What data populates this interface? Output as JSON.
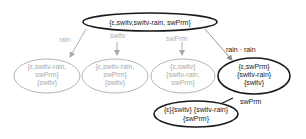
{
  "colors": {
    "active": "#1a1a1a",
    "faded_stroke": "#b5b5b5",
    "faded_text": "#aaaaaa",
    "active_edge": "#999999",
    "background": "#ffffff"
  },
  "nodes": {
    "root": {
      "lines": [
        "{ε,switv,switv-rain, swPrm}"
      ],
      "style": "active"
    },
    "n_rain": {
      "lines": [
        "{ε,switv-rain,",
        "swPrm}",
        "{switv}"
      ],
      "style": "faded"
    },
    "n_switv": {
      "lines": [
        "{ε,switv-rain,",
        "swPrm}",
        "{switv}"
      ],
      "style": "faded"
    },
    "n_swPrm": {
      "lines": [
        "{ε,switv}",
        "{switv-rain,",
        "swPrm}"
      ],
      "style": "faded"
    },
    "n_rainrain": {
      "lines": [
        "{ε,swPrm}",
        "{switv-rain}",
        "{switv}"
      ],
      "style": "active"
    },
    "n_final": {
      "lines": [
        "{ε}{switv} {switv-rain}",
        "{swPrm}"
      ],
      "style": "active"
    }
  },
  "edges": [
    {
      "from": "root",
      "to": "n_rain",
      "label": "rain",
      "style": "faded"
    },
    {
      "from": "root",
      "to": "n_switv",
      "label": "switv",
      "style": "faded"
    },
    {
      "from": "root",
      "to": "n_swPrm",
      "label": "swPrm",
      "style": "faded"
    },
    {
      "from": "root",
      "to": "n_rainrain",
      "label": "rain · rain",
      "style": "active"
    },
    {
      "from": "n_rainrain",
      "to": "n_final",
      "label": "swPrm",
      "style": "active"
    }
  ]
}
